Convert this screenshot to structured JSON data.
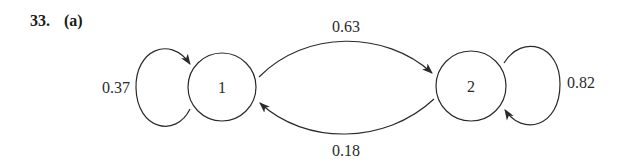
{
  "problem": {
    "number": "33.",
    "part": "(a)"
  },
  "diagram": {
    "type": "markov-chain-state-diagram",
    "stroke_color": "#2a2a2a",
    "states": [
      {
        "id": "1",
        "label": "1"
      },
      {
        "id": "2",
        "label": "2"
      }
    ],
    "transitions": [
      {
        "from": "1",
        "to": "1",
        "probability": "0.37"
      },
      {
        "from": "1",
        "to": "2",
        "probability": "0.63"
      },
      {
        "from": "2",
        "to": "1",
        "probability": "0.18"
      },
      {
        "from": "2",
        "to": "2",
        "probability": "0.82"
      }
    ]
  }
}
